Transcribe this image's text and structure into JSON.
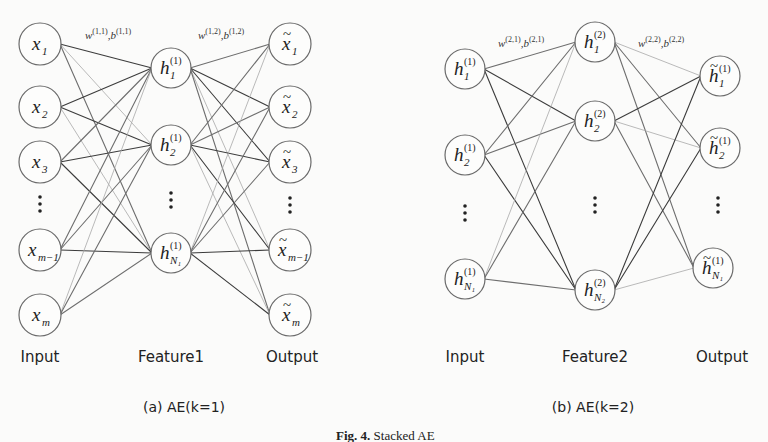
{
  "figure": {
    "caption_prefix": "Fig. 4.",
    "caption_text": " Stacked AE"
  },
  "panels": [
    {
      "id": "a",
      "subcaption": "(a) AE(k=1)",
      "subcaption_pos": [
        184,
        412
      ],
      "layer_labels": [
        {
          "text": "Input",
          "x": 40,
          "y": 362
        },
        {
          "text": "Feature1",
          "x": 171,
          "y": 362
        },
        {
          "text": "Output",
          "x": 292,
          "y": 362
        }
      ],
      "weight_labels": [
        {
          "w": "w",
          "w_sup": "(1,1)",
          "b": "b",
          "b_sup": "(1,1)",
          "x": 85,
          "y": 39
        },
        {
          "w": "w",
          "w_sup": "(1,2)",
          "b": "b",
          "b_sup": "(1,2)",
          "x": 198,
          "y": 39
        }
      ],
      "layers": [
        {
          "name": "input",
          "nodes": [
            {
              "x": 40,
              "y": 44,
              "r": 21,
              "base": "x",
              "sub": "1",
              "sup": "",
              "tilde": false
            },
            {
              "x": 40,
              "y": 107,
              "r": 21,
              "base": "x",
              "sub": "2",
              "sup": "",
              "tilde": false
            },
            {
              "x": 40,
              "y": 162,
              "r": 21,
              "base": "x",
              "sub": "3",
              "sup": "",
              "tilde": false
            },
            {
              "x": 40,
              "y": 250,
              "r": 21,
              "base": "x",
              "sub": "m−1",
              "sup": "",
              "tilde": false
            },
            {
              "x": 40,
              "y": 315,
              "r": 21,
              "base": "x",
              "sub": "m",
              "sup": "",
              "tilde": false
            }
          ],
          "dots": {
            "x": 40,
            "y": 204
          }
        },
        {
          "name": "feature1",
          "nodes": [
            {
              "x": 171,
              "y": 68,
              "r": 20,
              "base": "h",
              "sub": "1",
              "sup": "(1)",
              "tilde": false
            },
            {
              "x": 171,
              "y": 145,
              "r": 20,
              "base": "h",
              "sub": "2",
              "sup": "(1)",
              "tilde": false
            },
            {
              "x": 171,
              "y": 253,
              "r": 20,
              "base": "h",
              "sub": "N₁",
              "sup": "(1)",
              "tilde": false
            }
          ],
          "dots": {
            "x": 171,
            "y": 200
          }
        },
        {
          "name": "output",
          "nodes": [
            {
              "x": 290,
              "y": 44,
              "r": 21,
              "base": "x",
              "sub": "1",
              "sup": "",
              "tilde": true
            },
            {
              "x": 290,
              "y": 107,
              "r": 21,
              "base": "x",
              "sub": "2",
              "sup": "",
              "tilde": true
            },
            {
              "x": 290,
              "y": 162,
              "r": 21,
              "base": "x",
              "sub": "3",
              "sup": "",
              "tilde": true
            },
            {
              "x": 290,
              "y": 250,
              "r": 21,
              "base": "x",
              "sub": "m−1",
              "sup": "",
              "tilde": true
            },
            {
              "x": 290,
              "y": 315,
              "r": 21,
              "base": "x",
              "sub": "m",
              "sup": "",
              "tilde": true
            }
          ],
          "dots": {
            "x": 290,
            "y": 205
          }
        }
      ]
    },
    {
      "id": "b",
      "subcaption": "(b) AE(k=2)",
      "subcaption_pos": [
        593,
        412
      ],
      "layer_labels": [
        {
          "text": "Input",
          "x": 465,
          "y": 362
        },
        {
          "text": "Feature2",
          "x": 595,
          "y": 362
        },
        {
          "text": "Output",
          "x": 722,
          "y": 362
        }
      ],
      "weight_labels": [
        {
          "w": "w",
          "w_sup": "(2,1)",
          "b": "b",
          "b_sup": "(2,1)",
          "x": 498,
          "y": 47
        },
        {
          "w": "w",
          "w_sup": "(2,2)",
          "b": "b",
          "b_sup": "(2,2)",
          "x": 638,
          "y": 47
        }
      ],
      "layers": [
        {
          "name": "input",
          "nodes": [
            {
              "x": 465,
              "y": 69,
              "r": 20,
              "base": "h",
              "sub": "1",
              "sup": "(1)",
              "tilde": false
            },
            {
              "x": 465,
              "y": 155,
              "r": 20,
              "base": "h",
              "sub": "2",
              "sup": "(1)",
              "tilde": false
            },
            {
              "x": 465,
              "y": 279,
              "r": 20,
              "base": "h",
              "sub": "N₁",
              "sup": "(1)",
              "tilde": false
            }
          ],
          "dots": {
            "x": 465,
            "y": 213
          }
        },
        {
          "name": "feature2",
          "nodes": [
            {
              "x": 595,
              "y": 42,
              "r": 20,
              "base": "h",
              "sub": "1",
              "sup": "(2)",
              "tilde": false
            },
            {
              "x": 595,
              "y": 121,
              "r": 20,
              "base": "h",
              "sub": "2",
              "sup": "(2)",
              "tilde": false
            },
            {
              "x": 595,
              "y": 290,
              "r": 20,
              "base": "h",
              "sub": "N₂",
              "sup": "(2)",
              "tilde": false
            }
          ],
          "dots": {
            "x": 595,
            "y": 205
          }
        },
        {
          "name": "output",
          "nodes": [
            {
              "x": 720,
              "y": 76,
              "r": 20,
              "base": "h",
              "sub": "1",
              "sup": "(1)",
              "tilde": true
            },
            {
              "x": 720,
              "y": 148,
              "r": 20,
              "base": "h",
              "sub": "2",
              "sup": "(1)",
              "tilde": true
            },
            {
              "x": 713,
              "y": 268,
              "r": 20,
              "base": "h",
              "sub": "N₁",
              "sup": "(1)",
              "tilde": true
            }
          ],
          "dots": {
            "x": 718,
            "y": 205
          }
        }
      ]
    }
  ],
  "colors": {
    "edge_dark": "#3c3c3c",
    "edge_mid": "#6e6e6e",
    "edge_light": "#a8a8a8",
    "node_stroke": "#6a6a6a",
    "background": "#fbfbfa"
  }
}
